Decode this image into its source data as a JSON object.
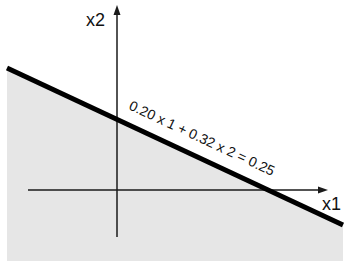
{
  "diagram": {
    "type": "linear-constraint-halfplane",
    "axes": {
      "x_label": "x1",
      "y_label": "x2"
    },
    "constraint_line": {
      "equation_label": "0.20 x 1 + 0.32 x 2 = 0.25",
      "coefficients": {
        "x1": 0.2,
        "x2": 0.32
      },
      "rhs": 0.25
    },
    "feasible_region": {
      "description": "shaded region below the line",
      "color": "#e6e6e6"
    },
    "colors": {
      "line": "#000000",
      "axis": "#1a1a1a",
      "background": "#ffffff"
    }
  }
}
